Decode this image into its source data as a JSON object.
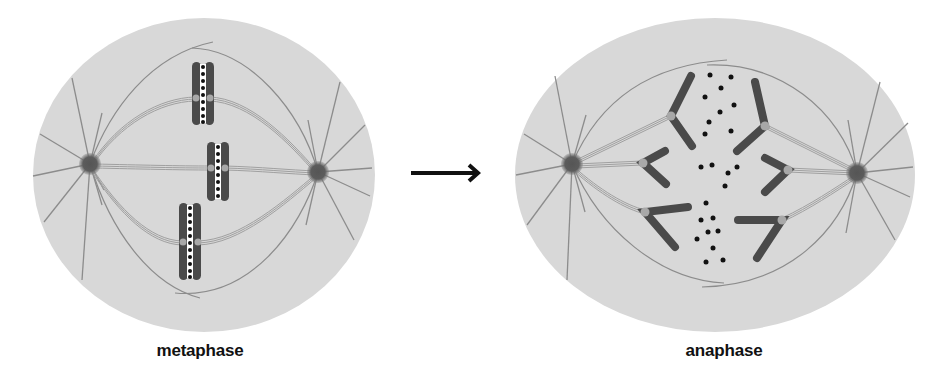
{
  "figure": {
    "panels": [
      {
        "id": "metaphase",
        "label": "metaphase"
      },
      {
        "id": "anaphase",
        "label": "anaphase"
      }
    ],
    "arrow": {
      "direction": "right",
      "icon": "right-arrow-icon"
    }
  },
  "colors": {
    "background": "#ffffff",
    "cell": "#d9d9d9",
    "cell_outline": "#cfcfcf",
    "centrosome": "#595959",
    "microtubule": "#8a8a8a",
    "spindle_fiber": "#a9a9a9",
    "chromosome": "#4a4a4a",
    "kinetochore": "#a8a8a8",
    "dot": "#111111",
    "arrow": "#111111",
    "label": "#111111"
  }
}
